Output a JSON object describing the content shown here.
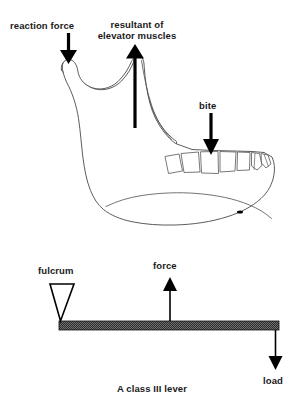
{
  "figure": {
    "caption": "A class III lever",
    "background_color": "#ffffff",
    "ink_color": "#000000",
    "outline_color": "#4a4a4a"
  },
  "anatomy_diagram": {
    "name": "mandible-lateral-view",
    "labels": [
      {
        "id": "reaction-force",
        "text": "reaction force",
        "arrow": "down-arrow-icon",
        "arrow_direction": "down",
        "points_at": "mandibular-condyle"
      },
      {
        "id": "resultant-of-elevator-muscles",
        "line1": "resultant of",
        "line2": "elevator muscles",
        "arrow": "up-arrow-icon",
        "arrow_direction": "up",
        "points_at": "coronoid-ramus-region"
      },
      {
        "id": "bite",
        "text": "bite",
        "arrow": "down-arrow-icon",
        "arrow_direction": "down",
        "points_at": "molar-teeth"
      }
    ],
    "teeth_count": 7
  },
  "lever_diagram": {
    "name": "class-three-lever-schematic",
    "bar_fill": "#3a3a3a",
    "labels": [
      {
        "id": "fulcrum",
        "text": "fulcrum",
        "marker": "triangle-icon",
        "marker_direction": "down"
      },
      {
        "id": "force",
        "text": "force",
        "arrow": "up-arrow-icon",
        "arrow_direction": "up"
      },
      {
        "id": "load",
        "text": "load",
        "arrow": "down-arrow-icon",
        "arrow_direction": "down"
      }
    ]
  },
  "caption": {
    "text": "A class III lever"
  }
}
